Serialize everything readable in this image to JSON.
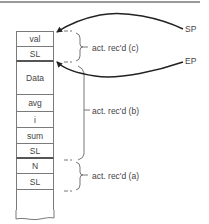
{
  "diagram": {
    "stack_cells": [
      {
        "label": "val",
        "height": 16
      },
      {
        "label": "SL",
        "height": 15
      },
      {
        "label": "Data",
        "height": 33
      },
      {
        "label": "avg",
        "height": 17
      },
      {
        "label": "i",
        "height": 16
      },
      {
        "label": "sum",
        "height": 16
      },
      {
        "label": "SL",
        "height": 15
      },
      {
        "label": "N",
        "height": 15
      },
      {
        "label": "SL",
        "height": 16
      },
      {
        "label": "",
        "height": 20
      }
    ],
    "records": [
      {
        "label": "act. rec'd (c)",
        "covers": [
          "val",
          "SL"
        ]
      },
      {
        "label": "act. rec'd (b)",
        "covers": [
          "Data",
          "avg",
          "i",
          "sum",
          "SL"
        ]
      },
      {
        "label": "act. rec'd (a)",
        "covers": [
          "N",
          "SL"
        ]
      }
    ],
    "pointers": [
      {
        "label": "SP",
        "points_to": "top of val"
      },
      {
        "label": "EP",
        "points_to": "bottom of SL (record c)"
      }
    ]
  }
}
